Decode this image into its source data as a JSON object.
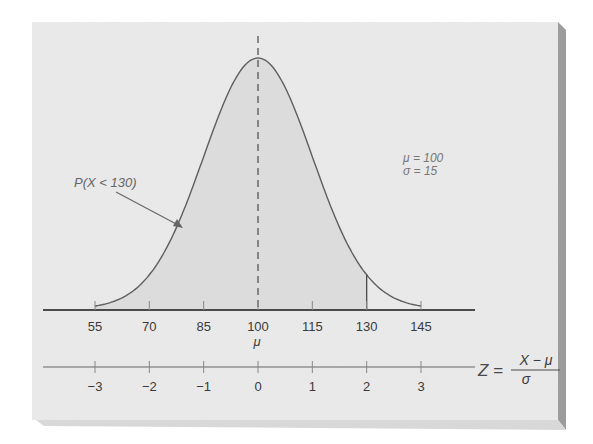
{
  "chart_data": {
    "type": "area",
    "title": "",
    "distribution": {
      "mean": 100,
      "sd": 15
    },
    "shaded_region": {
      "label": "P(X < 130)",
      "from": 55,
      "to": 130
    },
    "x_axis": {
      "ticks": [
        55,
        70,
        85,
        100,
        115,
        130,
        145
      ],
      "tick_labels": [
        "55",
        "70",
        "85",
        "100",
        "115",
        "130",
        "145"
      ],
      "mean_label": "μ",
      "range": [
        50,
        160
      ]
    },
    "z_axis": {
      "ticks": [
        -3,
        -2,
        -1,
        0,
        1,
        2,
        3
      ],
      "tick_labels": [
        "−3",
        "−2",
        "−1",
        "0",
        "1",
        "2",
        "3"
      ],
      "formula_lhs": "Z =",
      "formula_num": "X − μ",
      "formula_den": "σ"
    },
    "params_label": {
      "mu": "μ = 100",
      "sigma": "σ = 15"
    },
    "mean_line": {
      "x": 100,
      "style": "dashed"
    },
    "cutoff_line": {
      "x": 130,
      "style": "solid"
    },
    "grid": false,
    "legend": null,
    "colors": {
      "panel": "#ebebeb",
      "shade": "#dddddd",
      "curve": "#5a5a5a",
      "axis": "#4a4a4a",
      "text": "#3a3a3a",
      "shadow": "#9a9a9a"
    }
  }
}
